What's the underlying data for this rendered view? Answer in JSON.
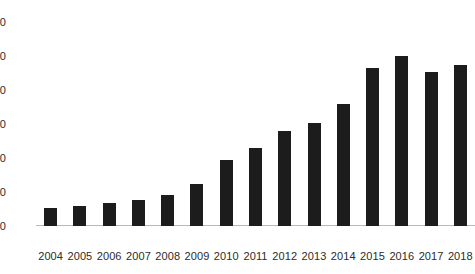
{
  "chart_data": {
    "type": "bar",
    "title": "",
    "subtitle": "",
    "xlabel": "",
    "ylabel": "",
    "categories": [
      "2004",
      "2005",
      "2006",
      "2007",
      "2008",
      "2009",
      "2010",
      "2011",
      "2012",
      "2013",
      "2014",
      "2015",
      "2016",
      "2017",
      "2018"
    ],
    "values": [
      53,
      59,
      68,
      76,
      91,
      124,
      194,
      229,
      279,
      303,
      359,
      465,
      500,
      453,
      474
    ],
    "series": [
      {
        "name": "",
        "values": [
          53,
          59,
          68,
          76,
          91,
          124,
          194,
          229,
          279,
          303,
          359,
          465,
          500,
          453,
          474
        ]
      }
    ],
    "ylim": [
      0,
      600
    ],
    "ytick_values": [
      0,
      100,
      200,
      300,
      400,
      500,
      600
    ],
    "ytick_labels": [
      "0",
      "100",
      "200",
      "300",
      "400",
      "500",
      "600"
    ],
    "ytick_labels_rendered": [
      "0",
      "00",
      "00",
      "00",
      "00",
      "00",
      "00"
    ],
    "xtick_labels": [
      "2004",
      "2005",
      "2006",
      "2007",
      "2008",
      "2009",
      "2010",
      "2011",
      "2012",
      "2013",
      "2014",
      "2015",
      "2016",
      "2017",
      "2018"
    ],
    "grid": false,
    "legend": false,
    "legend_position": "none",
    "bar_color": "#1c1c1c",
    "background_color": "#ffffff",
    "axis_label_color": "#2b2b2b",
    "baseline_color": "#b9b9b9"
  }
}
